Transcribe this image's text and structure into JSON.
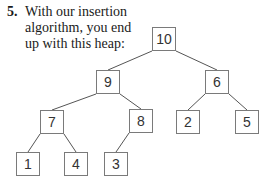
{
  "problem": {
    "number": "5.",
    "lines": [
      "With our insertion",
      "algorithm, you end",
      "up with this heap:"
    ]
  },
  "heap": {
    "nodes": [
      {
        "id": "n10",
        "value": "10",
        "x": 152,
        "y": 27
      },
      {
        "id": "n9",
        "value": "9",
        "x": 96,
        "y": 70
      },
      {
        "id": "n6",
        "value": "6",
        "x": 205,
        "y": 70
      },
      {
        "id": "n7",
        "value": "7",
        "x": 40,
        "y": 110
      },
      {
        "id": "n8",
        "value": "8",
        "x": 129,
        "y": 109
      },
      {
        "id": "n2",
        "value": "2",
        "x": 176,
        "y": 110
      },
      {
        "id": "n5",
        "value": "5",
        "x": 235,
        "y": 110
      },
      {
        "id": "n1",
        "value": "1",
        "x": 16,
        "y": 152
      },
      {
        "id": "n4",
        "value": "4",
        "x": 64,
        "y": 152
      },
      {
        "id": "n3",
        "value": "3",
        "x": 104,
        "y": 152
      }
    ],
    "edges": [
      [
        "n10",
        "n9"
      ],
      [
        "n10",
        "n6"
      ],
      [
        "n9",
        "n7"
      ],
      [
        "n9",
        "n8"
      ],
      [
        "n6",
        "n2"
      ],
      [
        "n6",
        "n5"
      ],
      [
        "n7",
        "n1"
      ],
      [
        "n7",
        "n4"
      ],
      [
        "n8",
        "n3"
      ]
    ],
    "line_color": "#555555"
  }
}
